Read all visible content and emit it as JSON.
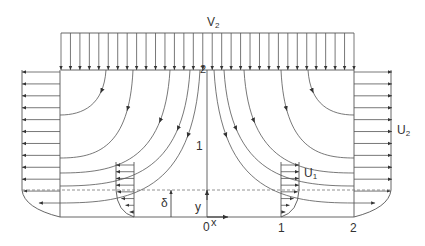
{
  "diagram": {
    "type": "stagnation-point flow with boundary layer",
    "labels": {
      "top_velocity": "V",
      "top_velocity_sub": "2",
      "right_velocity": "U",
      "right_velocity_sub": "2",
      "inner_velocity": "U",
      "inner_velocity_sub": "1",
      "station_2_top": "2",
      "station_1_axis": "1",
      "origin": "0",
      "x_axis": "x",
      "y_axis": "y",
      "boundary_layer_thickness": "δ",
      "station_1_bottom": "1",
      "station_2_bottom": "2"
    },
    "colors": {
      "line": "#4a4a4a",
      "dashed": "#777777",
      "text": "#333333",
      "background": "#ffffff"
    },
    "geometry": {
      "top_arrow_count": 32,
      "side_arrow_count": 12,
      "inner_profile_arrow_count": 8
    }
  }
}
